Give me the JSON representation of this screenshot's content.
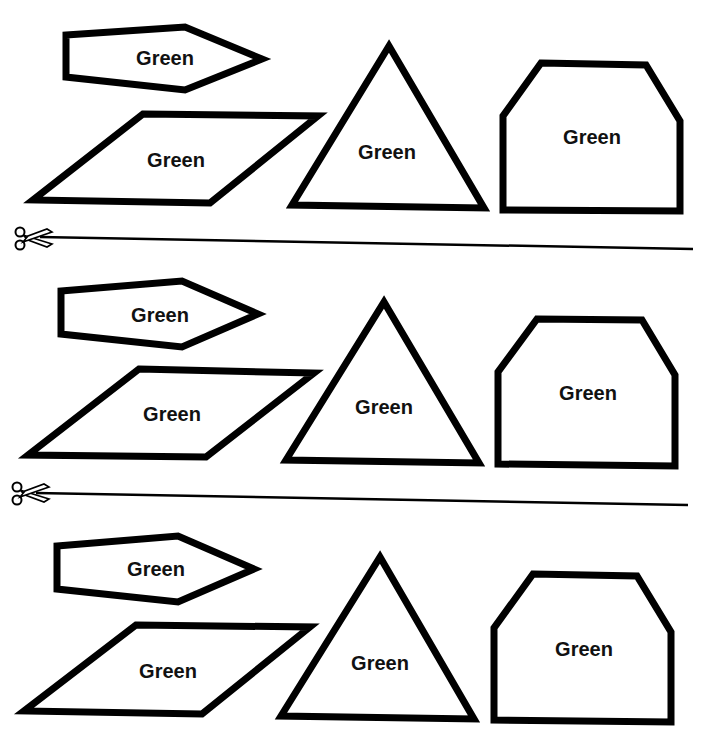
{
  "worksheet": {
    "colors": {
      "outline": "#000000",
      "background": "#ffffff",
      "text": "#111111"
    },
    "rows": [
      {
        "pentagon": {
          "label": "Green"
        },
        "parallelogram": {
          "label": "Green"
        },
        "triangle": {
          "label": "Green"
        },
        "house": {
          "label": "Green"
        }
      },
      {
        "pentagon": {
          "label": "Green"
        },
        "parallelogram": {
          "label": "Green"
        },
        "triangle": {
          "label": "Green"
        },
        "house": {
          "label": "Green"
        }
      },
      {
        "pentagon": {
          "label": "Green"
        },
        "parallelogram": {
          "label": "Green"
        },
        "triangle": {
          "label": "Green"
        },
        "house": {
          "label": "Green"
        }
      }
    ],
    "cut_lines": [
      {
        "icon": "scissors-icon"
      },
      {
        "icon": "scissors-icon"
      }
    ]
  }
}
